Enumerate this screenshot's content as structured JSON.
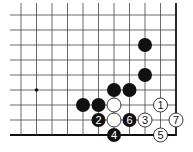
{
  "diagram": {
    "type": "go-board-fragment",
    "grid": {
      "origin_x": 21,
      "origin_y": 15,
      "col_spacing": 15.5,
      "row_spacing": 15,
      "cols": 11,
      "rows": 9,
      "line_start_x": 10,
      "line_start_y": 3,
      "right_edge": true,
      "bottom_edge": true,
      "line_color": "#444444",
      "edge_color": "#111111"
    },
    "star_points": [
      {
        "col": 1,
        "row": 5
      }
    ],
    "stones": [
      {
        "color": "black",
        "col": 8,
        "row": 2,
        "label": ""
      },
      {
        "color": "black",
        "col": 8,
        "row": 4,
        "label": ""
      },
      {
        "color": "black",
        "col": 6,
        "row": 5,
        "label": ""
      },
      {
        "color": "black",
        "col": 7,
        "row": 5,
        "label": ""
      },
      {
        "color": "black",
        "col": 4,
        "row": 6,
        "label": ""
      },
      {
        "color": "black",
        "col": 5,
        "row": 6,
        "label": ""
      },
      {
        "color": "white",
        "col": 6,
        "row": 6,
        "label": ""
      },
      {
        "color": "white",
        "col": 9,
        "row": 6,
        "label": "1"
      },
      {
        "color": "black",
        "col": 5,
        "row": 7,
        "label": "2"
      },
      {
        "color": "white",
        "col": 6,
        "row": 7,
        "label": ""
      },
      {
        "color": "black",
        "col": 7,
        "row": 7,
        "label": "6"
      },
      {
        "color": "white",
        "col": 8,
        "row": 7,
        "label": "3"
      },
      {
        "color": "white",
        "col": 10,
        "row": 7,
        "label": "7"
      },
      {
        "color": "black",
        "col": 6,
        "row": 8,
        "label": "4"
      },
      {
        "color": "white",
        "col": 9,
        "row": 8,
        "label": "5"
      }
    ],
    "stone_radius": 7,
    "colors": {
      "black_stone": "#111111",
      "white_stone": "#ffffff",
      "white_stone_stroke": "#222222",
      "black_label": "#ffffff",
      "white_label": "#111111"
    }
  }
}
